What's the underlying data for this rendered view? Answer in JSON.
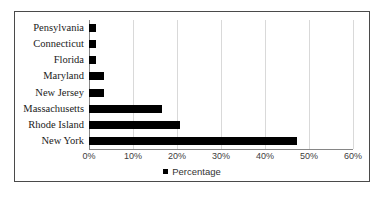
{
  "chart_data": {
    "type": "bar",
    "orientation": "horizontal",
    "title": "",
    "xlabel": "",
    "ylabel": "",
    "xlim": [
      0,
      60
    ],
    "xtick_labels": [
      "0%",
      "10%",
      "20%",
      "30%",
      "40%",
      "50%",
      "60%"
    ],
    "xticks": [
      0,
      10,
      20,
      30,
      40,
      50,
      60
    ],
    "grid": true,
    "legend": {
      "position": "bottom",
      "entries": [
        "Percentage"
      ]
    },
    "series_name": "Percentage",
    "bar_color": "#000000",
    "categories": [
      "Pensylvania",
      "Connecticut",
      "Florida",
      "Maryland",
      "New Jersey",
      "Massachusetts",
      "Rhode Island",
      "New York"
    ],
    "values": [
      1.6,
      1.6,
      1.6,
      3.4,
      3.4,
      16.6,
      20.7,
      47.3
    ],
    "value_labels": [
      "1.6%",
      "1.6%",
      "1.6%",
      "3.4%",
      "3.4%",
      "16.6%",
      "20.7%",
      "47.3%"
    ]
  }
}
